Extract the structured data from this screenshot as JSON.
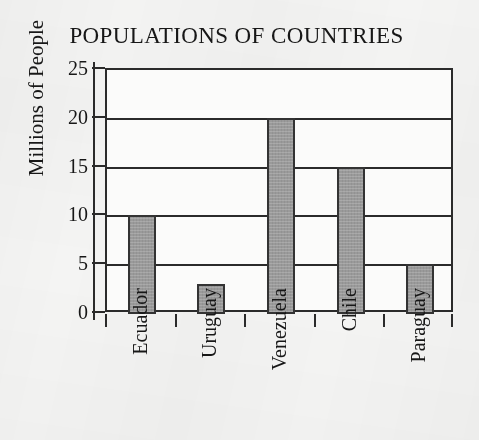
{
  "chart_data": {
    "type": "bar",
    "title": "POPULATIONS OF COUNTRIES",
    "xlabel": "",
    "ylabel": "Millions of People",
    "categories": [
      "Ecuador",
      "Uruguay",
      "Venezuela",
      "Chile",
      "Paraguay"
    ],
    "values": [
      10,
      3,
      20,
      15,
      5
    ],
    "ylim": [
      0,
      25
    ],
    "ytick_labels": [
      "0",
      "5",
      "10",
      "15",
      "20",
      "25"
    ],
    "ytick_values": [
      0,
      5,
      10,
      15,
      20,
      25
    ],
    "grid": "horizontal",
    "legend": "none",
    "bar_fill_color": "#9a9a9a",
    "bar_edge_color": "#333333",
    "axis_color": "#2b2b2b",
    "background_color": "#f4f4f3",
    "text_color": "#171717"
  }
}
